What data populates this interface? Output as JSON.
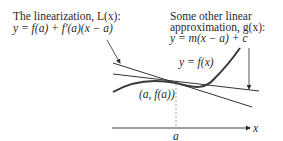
{
  "linearization": {
    "title": "The linearization, L(x):",
    "equation": "y = f(a) + f′(a)(x − a)"
  },
  "other_approximation": {
    "line1": "Some other linear",
    "line2": "approximation, g(x):",
    "equation": "y = m(x − a) + c"
  },
  "curve_label": "y = f(x)",
  "point_label": "(a, f(a))",
  "axis": {
    "x_label": "x",
    "tick_label": "a"
  },
  "colors": {
    "ink": "#2a2a2a",
    "curve": "#3a3a3a",
    "dashed": "#8a8a8a",
    "background": "#ffffff"
  }
}
